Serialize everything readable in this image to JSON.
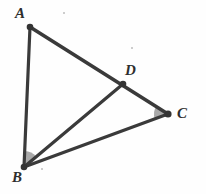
{
  "figure": {
    "width": 206,
    "height": 194,
    "background_color": "#fefefe",
    "stroke_color": "#3a3a3a",
    "label_color": "#2e2e2e",
    "angle_fill_color": "#9a9a9a",
    "points": {
      "A": {
        "label": "A",
        "x": 30,
        "y": 27,
        "label_x": 15,
        "label_y": 6
      },
      "B": {
        "label": "B",
        "x": 24,
        "y": 167,
        "label_x": 12,
        "label_y": 170
      },
      "C": {
        "label": "C",
        "x": 168,
        "y": 114,
        "label_x": 177,
        "label_y": 106
      },
      "D": {
        "label": "D",
        "x": 123,
        "y": 84,
        "label_x": 125,
        "label_y": 63
      }
    },
    "segments": [
      {
        "name": "segment-AB",
        "from": "A",
        "to": "B",
        "width": 3.2
      },
      {
        "name": "segment-AC",
        "from": "A",
        "to": "C",
        "width": 3.6
      },
      {
        "name": "segment-BC",
        "from": "B",
        "to": "C",
        "width": 3.2
      },
      {
        "name": "segment-BD",
        "from": "B",
        "to": "D",
        "width": 3.2
      }
    ],
    "angle_marks": [
      {
        "name": "angle-ABD",
        "vertex": "B",
        "radius": 16
      },
      {
        "name": "angle-BCD",
        "vertex": "C",
        "radius": 14
      }
    ],
    "specks": [
      {
        "x": 63,
        "y": 12,
        "size": 2
      },
      {
        "x": 131,
        "y": 47,
        "size": 2
      },
      {
        "x": 41,
        "y": 168,
        "size": 2
      }
    ]
  },
  "chart_data": {
    "type": "diagram",
    "vertices": [
      {
        "id": "A",
        "x": 30,
        "y": 27
      },
      {
        "id": "B",
        "x": 24,
        "y": 167
      },
      {
        "id": "C",
        "x": 168,
        "y": 114
      },
      {
        "id": "D",
        "x": 123,
        "y": 84
      }
    ],
    "edges": [
      [
        "A",
        "B"
      ],
      [
        "A",
        "C"
      ],
      [
        "B",
        "C"
      ],
      [
        "B",
        "D"
      ]
    ],
    "marked_angles": [
      "ABD",
      "BCD"
    ]
  }
}
